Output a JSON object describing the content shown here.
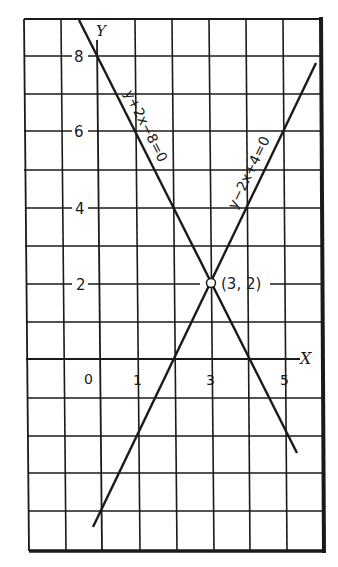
{
  "figure": {
    "type": "coordinate-graph",
    "axes": {
      "x_label": "X",
      "y_label": "Y",
      "x_tick_labels": [
        {
          "value": 0,
          "label": "0"
        },
        {
          "value": 1,
          "label": "1"
        },
        {
          "value": 3,
          "label": "3"
        },
        {
          "value": 5,
          "label": "5"
        }
      ],
      "y_tick_labels": [
        {
          "value": 8,
          "label": "8"
        },
        {
          "value": 6,
          "label": "6"
        },
        {
          "value": 4,
          "label": "4"
        },
        {
          "value": 2,
          "label": "2"
        }
      ],
      "x_range": [
        -2,
        6
      ],
      "y_range": [
        -5,
        9
      ],
      "grid": true
    },
    "lines": [
      {
        "equation": "y+2x−8=0",
        "slope": -2,
        "intercept": 8,
        "color": "#1a1a1a"
      },
      {
        "equation": "y−2x+4=0",
        "slope": 2,
        "intercept": -4,
        "color": "#1a1a1a"
      }
    ],
    "intersection": {
      "x": 3,
      "y": 2,
      "label": "(3, 2)"
    }
  },
  "colors": {
    "ink": "#1a1a1a",
    "paper": "#ffffff"
  }
}
